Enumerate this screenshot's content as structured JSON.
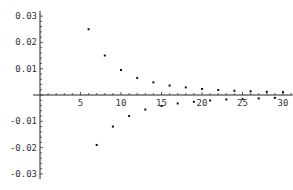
{
  "chart_data": {
    "type": "scatter",
    "title": "",
    "xlabel": "",
    "ylabel": "",
    "xlim": [
      0,
      31
    ],
    "ylim": [
      -0.03,
      0.03
    ],
    "grid": false,
    "x_ticks": [
      5,
      10,
      15,
      20,
      25,
      30
    ],
    "x_tick_labels": [
      "5",
      "10",
      "15",
      "20",
      "25",
      "30"
    ],
    "y_ticks": [
      0.03,
      0.02,
      0.01,
      -0.01,
      -0.02,
      -0.03
    ],
    "y_tick_labels": [
      "0.03",
      "0.02",
      "0.01",
      "-0.01",
      "-0.02",
      "-0.03"
    ],
    "points": [
      {
        "x": 6,
        "y": 0.025
      },
      {
        "x": 7,
        "y": -0.019
      },
      {
        "x": 8,
        "y": 0.015
      },
      {
        "x": 9,
        "y": -0.012
      },
      {
        "x": 10,
        "y": 0.0095
      },
      {
        "x": 11,
        "y": -0.008
      },
      {
        "x": 12,
        "y": 0.0065
      },
      {
        "x": 13,
        "y": -0.0055
      },
      {
        "x": 14,
        "y": 0.0048
      },
      {
        "x": 15,
        "y": -0.0042
      },
      {
        "x": 16,
        "y": 0.0036
      },
      {
        "x": 17,
        "y": -0.0032
      },
      {
        "x": 18,
        "y": 0.0029
      },
      {
        "x": 19,
        "y": -0.0026
      },
      {
        "x": 20,
        "y": 0.0023
      },
      {
        "x": 21,
        "y": -0.0021
      },
      {
        "x": 22,
        "y": 0.0019
      },
      {
        "x": 23,
        "y": -0.0017
      },
      {
        "x": 24,
        "y": 0.0016
      },
      {
        "x": 25,
        "y": -0.0015
      },
      {
        "x": 26,
        "y": 0.0014
      },
      {
        "x": 27,
        "y": -0.0013
      },
      {
        "x": 28,
        "y": 0.0012
      },
      {
        "x": 29,
        "y": -0.0011
      },
      {
        "x": 30,
        "y": 0.0011
      }
    ]
  }
}
